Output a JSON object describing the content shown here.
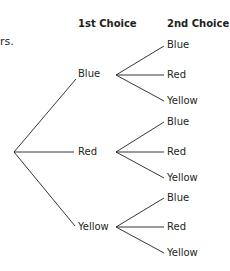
{
  "fragment_text": "rs.",
  "headers": {
    "first": "1st Choice",
    "second": "2nd Choice"
  },
  "tree": {
    "root": {
      "x": 14,
      "y": 152
    },
    "first_choices": [
      {
        "label": "Blue",
        "label_pos": {
          "x": 78,
          "y": 68
        },
        "line_end": {
          "x": 76,
          "y": 79
        },
        "branch_pt": {
          "x": 116,
          "y": 75
        },
        "second_choices": [
          {
            "label": "Blue",
            "end": {
              "x": 164,
              "y": 46
            }
          },
          {
            "label": "Red",
            "end": {
              "x": 164,
              "y": 75
            }
          },
          {
            "label": "Yellow",
            "end": {
              "x": 164,
              "y": 101
            }
          }
        ]
      },
      {
        "label": "Red",
        "label_pos": {
          "x": 78,
          "y": 146
        },
        "line_end": {
          "x": 74,
          "y": 152
        },
        "branch_pt": {
          "x": 116,
          "y": 152
        },
        "second_choices": [
          {
            "label": "Blue",
            "end": {
              "x": 164,
              "y": 122
            }
          },
          {
            "label": "Red",
            "end": {
              "x": 164,
              "y": 152
            }
          },
          {
            "label": "Yellow",
            "end": {
              "x": 164,
              "y": 178
            }
          }
        ]
      },
      {
        "label": "Yellow",
        "label_pos": {
          "x": 78,
          "y": 221
        },
        "line_end": {
          "x": 75,
          "y": 226
        },
        "branch_pt": {
          "x": 116,
          "y": 227
        },
        "second_choices": [
          {
            "label": "Blue",
            "end": {
              "x": 164,
              "y": 198
            }
          },
          {
            "label": "Red",
            "end": {
              "x": 164,
              "y": 227
            }
          },
          {
            "label": "Yellow",
            "end": {
              "x": 164,
              "y": 253
            }
          }
        ]
      }
    ]
  }
}
